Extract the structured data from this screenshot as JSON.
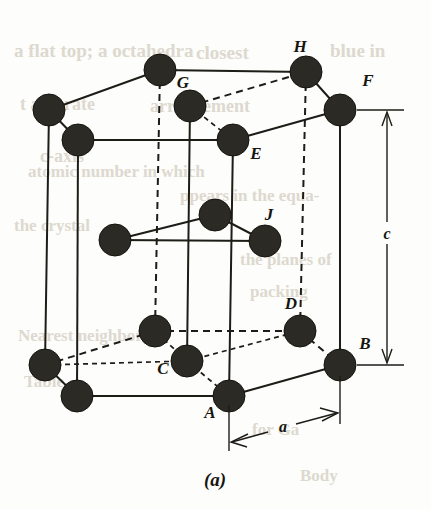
{
  "figure": {
    "caption": "(a)",
    "background_color": "#fdfdfb",
    "atom_color": "#2b2a24",
    "line_color": "#1d1c16"
  },
  "dimensions": [
    {
      "id": "a",
      "label": "a",
      "orientation": "horizontal",
      "description": "basal plane edge length from A to B"
    },
    {
      "id": "c",
      "label": "c",
      "orientation": "vertical",
      "description": "cell height from bottom basal plane to top basal plane"
    }
  ],
  "labels": [
    {
      "id": "H",
      "text": "H",
      "x": 306,
      "y": 48
    },
    {
      "id": "G",
      "text": "G",
      "x": 183,
      "y": 84
    },
    {
      "id": "F",
      "text": "F",
      "x": 368,
      "y": 82
    },
    {
      "id": "E",
      "text": "E",
      "x": 252,
      "y": 155
    },
    {
      "id": "J",
      "text": "J",
      "x": 268,
      "y": 222
    },
    {
      "id": "D",
      "text": "D",
      "x": 289,
      "y": 311
    },
    {
      "id": "B",
      "text": "B",
      "x": 362,
      "y": 347
    },
    {
      "id": "C",
      "text": "C",
      "x": 166,
      "y": 372
    },
    {
      "id": "A",
      "text": "A",
      "x": 212,
      "y": 414
    }
  ],
  "atoms": {
    "top_plane": [
      {
        "id": "T_back_left",
        "x": 49,
        "y": 110,
        "r": 16,
        "label": null
      },
      {
        "id": "T_back_mid",
        "x": 160,
        "y": 70,
        "r": 16,
        "label": null
      },
      {
        "id": "T_H",
        "x": 306,
        "y": 72,
        "r": 16,
        "label": "H"
      },
      {
        "id": "T_F",
        "x": 340,
        "y": 110,
        "r": 16,
        "label": "F"
      },
      {
        "id": "T_E",
        "x": 233,
        "y": 140,
        "r": 16,
        "label": "E"
      },
      {
        "id": "T_front_left",
        "x": 78,
        "y": 140,
        "r": 16,
        "label": null
      },
      {
        "id": "T_G_center",
        "x": 190,
        "y": 106,
        "r": 16,
        "label": "G"
      }
    ],
    "middle_plane": [
      {
        "id": "M_left",
        "x": 115,
        "y": 240,
        "r": 16,
        "label": null
      },
      {
        "id": "M_top",
        "x": 215,
        "y": 215,
        "r": 16,
        "label": null
      },
      {
        "id": "M_right",
        "x": 265,
        "y": 241,
        "r": 16,
        "label": "J"
      }
    ],
    "bottom_plane": [
      {
        "id": "B_back_left",
        "x": 45,
        "y": 365,
        "r": 16,
        "label": null
      },
      {
        "id": "B_back_mid",
        "x": 155,
        "y": 331,
        "r": 16,
        "label": null
      },
      {
        "id": "B_D",
        "x": 300,
        "y": 331,
        "r": 16,
        "label": "D"
      },
      {
        "id": "B_B",
        "x": 340,
        "y": 365,
        "r": 16,
        "label": "B"
      },
      {
        "id": "B_A",
        "x": 229,
        "y": 396,
        "r": 16,
        "label": "A"
      },
      {
        "id": "B_front_left",
        "x": 77,
        "y": 396,
        "r": 16,
        "label": null
      },
      {
        "id": "B_C_center",
        "x": 187,
        "y": 361,
        "r": 16,
        "label": "C"
      }
    ]
  },
  "scan_bleed_text": [
    {
      "text": "a flat top; a octahedra",
      "x": 14,
      "y": 40,
      "size": 19
    },
    {
      "text": "closest",
      "x": 196,
      "y": 42,
      "size": 19
    },
    {
      "text": "blue in",
      "x": 330,
      "y": 40,
      "size": 19
    },
    {
      "text": "t and rate",
      "x": 20,
      "y": 94,
      "size": 18
    },
    {
      "text": "arrangement",
      "x": 150,
      "y": 96,
      "size": 18
    },
    {
      "text": "c-axis",
      "x": 40,
      "y": 146,
      "size": 18
    },
    {
      "text": "atomic number in which",
      "x": 28,
      "y": 162,
      "size": 17
    },
    {
      "text": "ppears in the equa-",
      "x": 180,
      "y": 186,
      "size": 17
    },
    {
      "text": "the crystal",
      "x": 14,
      "y": 216,
      "size": 17
    },
    {
      "text": "the planes of",
      "x": 240,
      "y": 250,
      "size": 17
    },
    {
      "text": "Nearest neighbor",
      "x": 18,
      "y": 326,
      "size": 17
    },
    {
      "text": "packing",
      "x": 250,
      "y": 282,
      "size": 17
    },
    {
      "text": "Table",
      "x": 24,
      "y": 372,
      "size": 17
    },
    {
      "text": "for Ga",
      "x": 252,
      "y": 420,
      "size": 17
    },
    {
      "text": "Body",
      "x": 300,
      "y": 466,
      "size": 17
    }
  ]
}
